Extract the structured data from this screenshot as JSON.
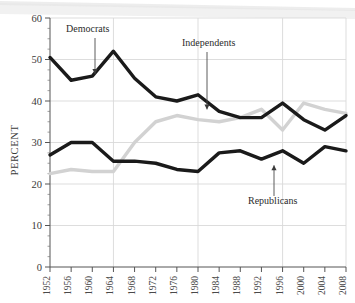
{
  "chart_data": {
    "type": "line",
    "title": "",
    "subtitle": "",
    "xlabel": "",
    "ylabel": "PERCENT",
    "ylim": [
      0,
      60
    ],
    "ytick_values": [
      0,
      10,
      20,
      30,
      40,
      50,
      60
    ],
    "ytick_labels": [
      "0",
      "10",
      "20",
      "30",
      "40",
      "50",
      "60"
    ],
    "grid": true,
    "grid_axis": "both",
    "legend_position": "inline-annotations",
    "x": [
      1952,
      1956,
      1960,
      1964,
      1968,
      1972,
      1976,
      1980,
      1984,
      1988,
      1992,
      1996,
      2000,
      2004,
      2008
    ],
    "categories": [
      "1952",
      "1956",
      "1960",
      "1964",
      "1968",
      "1972",
      "1976",
      "1980",
      "1984",
      "1988",
      "1992",
      "1996",
      "2000",
      "2004",
      "2008"
    ],
    "series": [
      {
        "name": "Democrats",
        "color": "#1a1a1a",
        "width": 3.4,
        "values": [
          50.5,
          45.0,
          46.0,
          52.0,
          45.5,
          41.0,
          40.0,
          41.5,
          37.5,
          36.0,
          36.0,
          39.5,
          35.5,
          33.0,
          36.5
        ]
      },
      {
        "name": "Republicans",
        "color": "#1a1a1a",
        "width": 3.4,
        "values": [
          27.0,
          30.0,
          30.0,
          25.5,
          25.5,
          25.0,
          23.5,
          23.0,
          27.5,
          28.0,
          26.0,
          28.0,
          25.0,
          29.0,
          28.0
        ]
      },
      {
        "name": "Independents",
        "color": "#d2d2d2",
        "width": 3.4,
        "values": [
          22.5,
          23.5,
          23.0,
          23.0,
          30.0,
          35.0,
          36.5,
          35.5,
          35.0,
          36.0,
          38.0,
          33.0,
          39.5,
          38.0,
          37.0
        ]
      }
    ],
    "annotations": [
      {
        "name": "Democrats",
        "label": "Democrats",
        "target_year": 1960,
        "target_value": 46.0
      },
      {
        "name": "Independents",
        "label": "Independents",
        "target_year": 1984,
        "target_value": 37.5
      },
      {
        "name": "Republicans",
        "label": "Republicans",
        "target_year": 2000,
        "target_value": 25.0
      }
    ]
  },
  "axes": {
    "ylabel": "PERCENT"
  }
}
